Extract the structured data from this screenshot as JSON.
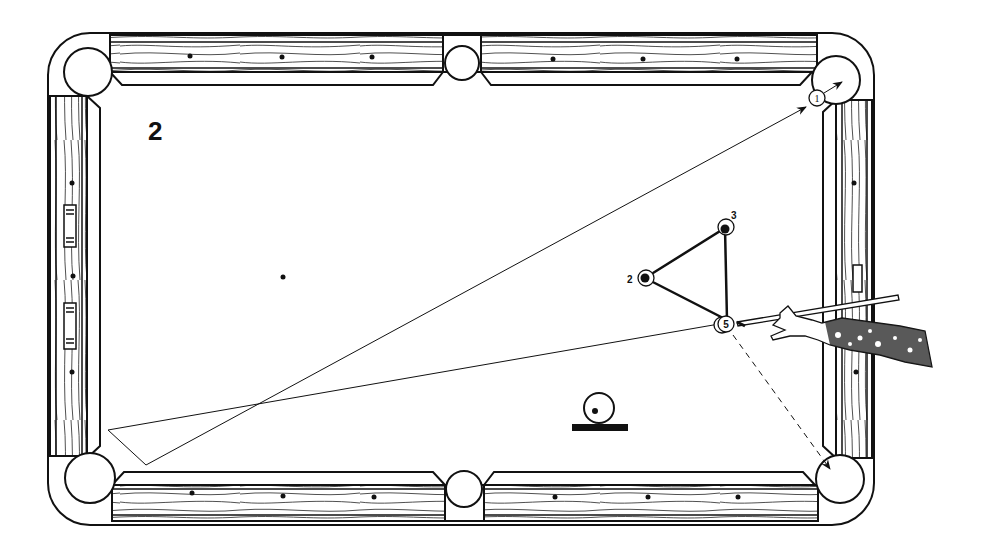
{
  "diagram": {
    "number_label": "2",
    "ink_color": "#111111",
    "background_color": "#ffffff"
  },
  "balls": [
    {
      "label": "1",
      "x": 817,
      "y": 98,
      "role": "object ball at top-right corner pocket"
    },
    {
      "label": "2",
      "x": 645,
      "y": 278,
      "role": "ball"
    },
    {
      "label": "3",
      "x": 724,
      "y": 228,
      "role": "ball"
    },
    {
      "label": "5",
      "x": 724,
      "y": 324,
      "role": "ball struck by cue"
    }
  ],
  "paths": [
    {
      "name": "cue-ball-path",
      "from": "ball 5",
      "via": "bottom-left bank point",
      "to": "ball 1 / top-right pocket",
      "style": "solid with arrow"
    },
    {
      "name": "ball-5-path",
      "from": "ball 5",
      "to": "bottom-right pocket",
      "style": "dashed with arrow"
    },
    {
      "name": "triangle-2-3-5",
      "style": "bold solid"
    }
  ],
  "legend_symbol": {
    "name": "cue-ball-position-symbol",
    "x": 599,
    "y": 410
  },
  "table": {
    "pockets": [
      "top-left",
      "top-middle",
      "top-right",
      "bottom-left",
      "bottom-middle",
      "bottom-right"
    ],
    "diamonds": "marked on all rails"
  }
}
